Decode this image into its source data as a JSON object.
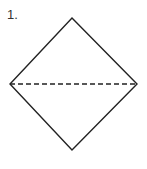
{
  "diagram": {
    "step_label": "1.",
    "shape": "square rotated 45 degrees (diamond)",
    "vertices": {
      "top": [
        72,
        18
      ],
      "right": [
        137,
        84
      ],
      "bottom": [
        72,
        150
      ],
      "left": [
        10,
        84
      ]
    },
    "fold_line": {
      "type": "valley-fold (dashed)",
      "from": [
        10,
        84
      ],
      "to": [
        137,
        84
      ]
    },
    "colors": {
      "stroke": "#222222",
      "background": "#ffffff",
      "label": "#333333"
    }
  }
}
